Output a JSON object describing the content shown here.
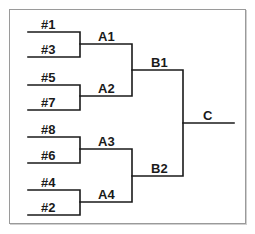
{
  "diagram": {
    "type": "tournament-bracket",
    "line_color": "#1a1a1a",
    "border_color": "#9a9a9a",
    "round1": {
      "seeds": [
        {
          "label": "#1",
          "x": 41,
          "y": 19
        },
        {
          "label": "#3",
          "x": 41,
          "y": 44
        },
        {
          "label": "#5",
          "x": 41,
          "y": 72
        },
        {
          "label": "#7",
          "x": 41,
          "y": 97
        },
        {
          "label": "#8",
          "x": 41,
          "y": 124
        },
        {
          "label": "#6",
          "x": 41,
          "y": 150
        },
        {
          "label": "#4",
          "x": 41,
          "y": 177
        },
        {
          "label": "#2",
          "x": 41,
          "y": 202
        }
      ]
    },
    "round2": {
      "winners": [
        {
          "label": "A1",
          "x": 98,
          "y": 30
        },
        {
          "label": "A2",
          "x": 98,
          "y": 83
        },
        {
          "label": "A3",
          "x": 98,
          "y": 136
        },
        {
          "label": "A4",
          "x": 98,
          "y": 189
        }
      ]
    },
    "round3": {
      "winners": [
        {
          "label": "B1",
          "x": 151,
          "y": 57
        },
        {
          "label": "B2",
          "x": 151,
          "y": 163
        }
      ]
    },
    "final": {
      "winner": {
        "label": "C",
        "x": 204,
        "y": 110
      }
    }
  }
}
